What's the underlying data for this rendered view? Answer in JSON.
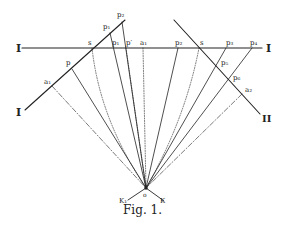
{
  "figure": {
    "caption": "Fig. 1.",
    "line_labels": {
      "horizontal_left": "I",
      "horizontal_right": "I",
      "oblique_left": "I",
      "oblique_right": "II"
    },
    "point_labels": {
      "p2": "p₂",
      "p1": "p₁",
      "s_left": "s",
      "p1_h": "p₁",
      "pprime": "p′",
      "a1_h": "a₁",
      "p_left_oblique": "p",
      "a1_left": "a₁",
      "p2_h": "p₂",
      "s_right": "s",
      "p3_h": "p₃",
      "p4_h": "p₄",
      "p5_r": "p₅",
      "p6_r": "p₆",
      "a2_r": "a₂",
      "o": "o",
      "k_left": "K₁",
      "k_right": "K"
    },
    "colors": {
      "ink": "#222222",
      "background": "#ffffff"
    }
  }
}
